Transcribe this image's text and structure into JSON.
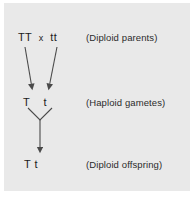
{
  "diagram": {
    "background_color": "#e9e9e9",
    "line_color": "#4a4a4a",
    "text_color": "#1c1c1c",
    "rows": [
      {
        "id": "parents",
        "genotype": "TT  x  tt",
        "allele_left": "TT",
        "cross_symbol": "x",
        "allele_right": "tt",
        "label": "(Diploid parents)"
      },
      {
        "id": "gametes",
        "genotype": "T    t",
        "allele_left": "T",
        "allele_right": "t",
        "label": "(Haploid gametes)"
      },
      {
        "id": "offspring",
        "genotype": "T t",
        "allele_left": "T",
        "allele_right": "t",
        "label": "(Diploid offspring)"
      }
    ],
    "connectors": [
      {
        "name": "meiosis-arrow-left",
        "from": "TT",
        "to": "T"
      },
      {
        "name": "meiosis-arrow-right",
        "from": "tt",
        "to": "t"
      },
      {
        "name": "fertilization-v-join",
        "from": "T and t gametes",
        "to": "zygote"
      },
      {
        "name": "fertilization-arrow",
        "from": "zygote",
        "to": "T t offspring"
      }
    ]
  }
}
